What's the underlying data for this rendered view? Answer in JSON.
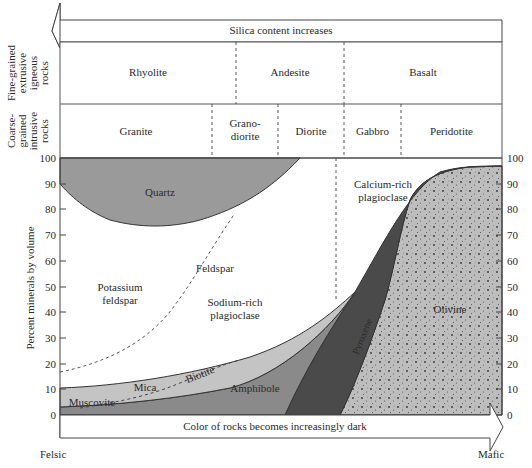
{
  "header": {
    "silica_arrow_label": "Silica content increases"
  },
  "rows": {
    "fine_grained": {
      "title_lines": [
        "Fine-grained",
        "extrusive",
        "igneous",
        "rocks"
      ],
      "rocks": [
        "Rhyolite",
        "Andesite",
        "Basalt"
      ]
    },
    "coarse_grained": {
      "title_lines": [
        "Coarse-",
        "grained",
        "intrusive",
        "rocks"
      ],
      "rocks": [
        "Granite",
        "Grano-",
        "diorite",
        "Diorite",
        "Gabbro",
        "Peridotite"
      ]
    }
  },
  "axis": {
    "ylabel": "Percent minerals by volume",
    "ticks": [
      "0",
      "10",
      "20",
      "30",
      "40",
      "50",
      "60",
      "70",
      "80",
      "90",
      "100"
    ]
  },
  "minerals": {
    "quartz": "Quartz",
    "potassium_feldspar_1": "Potassium",
    "potassium_feldspar_2": "feldspar",
    "feldspar": "Feldspar",
    "sodium_plag_1": "Sodium-rich",
    "sodium_plag_2": "plagioclase",
    "calcium_plag_1": "Calcium-rich",
    "calcium_plag_2": "plagioclase",
    "mica": "Mica",
    "muscovite": "Muscovite",
    "biotite": "Biotite",
    "amphibole": "Amphibole",
    "pyroxene": "Pyroxene",
    "olivine": "Olivine"
  },
  "footer": {
    "color_arrow_label": "Color of rocks becomes increasingly dark",
    "left_end": "Felsic",
    "right_end": "Mafic"
  },
  "colors": {
    "quartz": "#9a9a9a",
    "mica": "#c4c4c4",
    "amphibole": "#8a8a8a",
    "pyroxene": "#4a4a4a",
    "olivine": "#bdbdbd",
    "outline": "#3a3a3a"
  }
}
